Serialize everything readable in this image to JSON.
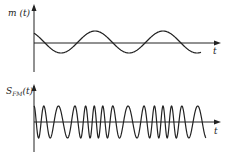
{
  "figure": {
    "top_plot": {
      "ylabel": "m (t)",
      "xlabel": "t",
      "description": "modulating signal, sinusoid"
    },
    "bottom_plot": {
      "ylabel_main": "S",
      "ylabel_sub": "FM",
      "ylabel_tail": "(t)",
      "xlabel": "t",
      "description": "frequency-modulated carrier"
    }
  },
  "chart_data": [
    {
      "type": "line",
      "title": "m(t)",
      "xlabel": "t",
      "ylabel": "m(t)",
      "series": [
        {
          "name": "m(t)",
          "shape": "cosine",
          "cycles": 2.6,
          "amplitude": 1
        }
      ],
      "grid": false
    },
    {
      "type": "line",
      "title": "S_FM(t)",
      "xlabel": "t",
      "ylabel": "S_FM(t)",
      "series": [
        {
          "name": "S_FM(t)",
          "shape": "FM sinusoid, frequency follows m(t)",
          "amplitude": 1
        }
      ],
      "grid": false
    }
  ],
  "colors": {
    "ink": "#222222",
    "background": "#ffffff"
  }
}
